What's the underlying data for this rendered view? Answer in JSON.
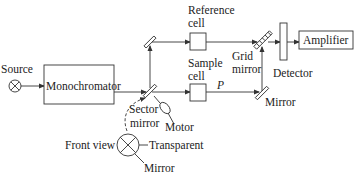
{
  "labels": {
    "source": "Source",
    "monochromator": "Monochromator",
    "reference_cell_line1": "Reference",
    "reference_cell_line2": "cell",
    "sample_cell_line1": "Sample",
    "sample_cell_line2": "cell",
    "path": "P",
    "grid_mirror_line1": "Grid",
    "grid_mirror_line2": "mirror",
    "detector": "Detector",
    "amplifier": "Amplifier",
    "mirror_right": "Mirror",
    "sector_mirror_line1": "Sector",
    "sector_mirror_line2": "mirror",
    "motor": "Motor",
    "front_view": "Front view",
    "transparent": "Transparent",
    "mirror_front": "Mirror"
  },
  "colors": {
    "line": "#333333",
    "text": "#222222",
    "background": "#ffffff"
  }
}
